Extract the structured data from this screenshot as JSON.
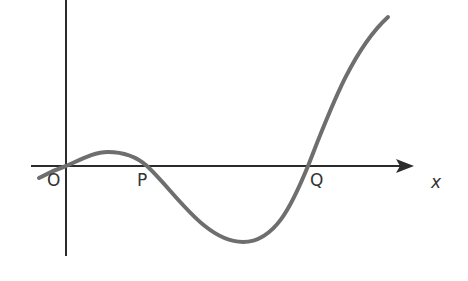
{
  "diagram": {
    "type": "function-graph",
    "colors": {
      "axes": "#2b2b2b",
      "curve": "#6e6e6e",
      "label": "#333333",
      "background": "#ffffff"
    },
    "axes": {
      "x_label": "x",
      "origin_label": "O"
    },
    "points": [
      {
        "label": "O",
        "role": "origin / root"
      },
      {
        "label": "P",
        "role": "root"
      },
      {
        "label": "Q",
        "role": "root"
      }
    ],
    "labels": {
      "O": "O",
      "P": "P",
      "Q": "Q",
      "x": "x"
    }
  }
}
